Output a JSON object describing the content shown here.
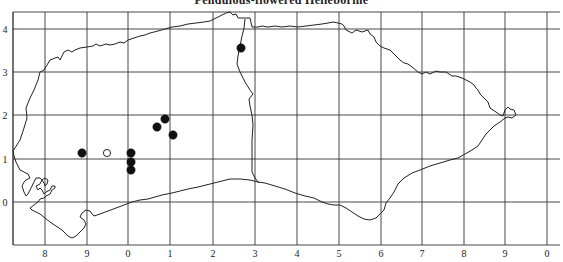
{
  "title": "Pendulous-flowered Helleborine",
  "map": {
    "grid": {
      "left": 13,
      "right": 547,
      "top": 12,
      "bottom": 245,
      "vertical_lines_x": [
        13,
        45,
        87,
        128,
        170,
        213,
        255,
        297,
        339,
        381,
        422,
        464,
        505,
        547
      ],
      "horizontal_lines_y": [
        12,
        29,
        72,
        115,
        159,
        202,
        245
      ]
    },
    "x_axis": {
      "labels": [
        "8",
        "9",
        "0",
        "1",
        "2",
        "3",
        "4",
        "5",
        "6",
        "7",
        "8",
        "9",
        "0"
      ],
      "positions": [
        45,
        87,
        128,
        170,
        213,
        255,
        297,
        339,
        381,
        422,
        464,
        505,
        547
      ],
      "label_y": 257
    },
    "y_axis": {
      "labels": [
        "4",
        "3",
        "2",
        "1",
        "0"
      ],
      "positions": [
        29,
        72,
        115,
        159,
        202
      ],
      "label_x": 5
    },
    "records": [
      {
        "x": 82,
        "y": 153,
        "type": "filled"
      },
      {
        "x": 107,
        "y": 153,
        "type": "hollow"
      },
      {
        "x": 131,
        "y": 153,
        "type": "filled"
      },
      {
        "x": 131,
        "y": 162,
        "type": "filled"
      },
      {
        "x": 131,
        "y": 170,
        "type": "filled"
      },
      {
        "x": 157,
        "y": 127,
        "type": "filled"
      },
      {
        "x": 165,
        "y": 119,
        "type": "filled"
      },
      {
        "x": 173,
        "y": 135,
        "type": "filled"
      },
      {
        "x": 241,
        "y": 48,
        "type": "filled"
      }
    ],
    "legend": {
      "filled": "record (solid dot)",
      "hollow": "record (open circle)"
    }
  }
}
